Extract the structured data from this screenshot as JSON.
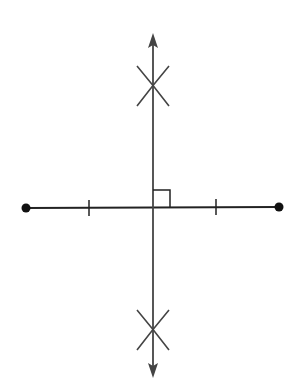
{
  "diagram": {
    "colors": {
      "background": "#ffffff",
      "segment": "#222222",
      "bisector": "#444444",
      "arcs": "#444444",
      "endpoint": "#111111"
    },
    "segment": {
      "endpoint_left": {
        "x": 26,
        "y": 208,
        "r": 4.5
      },
      "endpoint_right": {
        "x": 279,
        "y": 207,
        "r": 4.5
      },
      "tick_marks": [
        {
          "x": 89,
          "y": 208
        },
        {
          "x": 216,
          "y": 207
        }
      ]
    },
    "bisector": {
      "x": 153,
      "top_arrow_tip_y": 33,
      "bottom_arrow_tip_y": 378
    },
    "arc_intersections": [
      {
        "name": "upper",
        "x": 153,
        "y": 86
      },
      {
        "name": "lower",
        "x": 153,
        "y": 330
      }
    ],
    "right_angle_marker": {
      "x": 153,
      "y": 190,
      "size": 17
    }
  }
}
